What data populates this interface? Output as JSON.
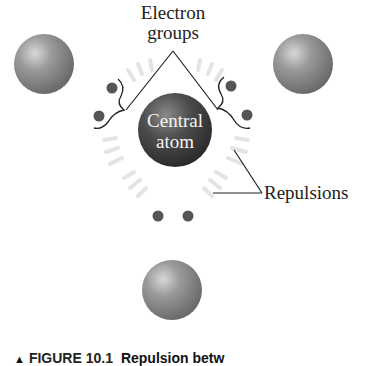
{
  "figure": {
    "labels": {
      "electron_groups_line1": "Electron",
      "electron_groups_line2": "groups",
      "central_atom_line1": "Central",
      "central_atom_line2": "atom",
      "repulsions": "Repulsions"
    },
    "caption": {
      "marker": "▲",
      "figure_number": "FIGURE 10.1",
      "title_visible": "Repulsion betw"
    },
    "colors": {
      "outer_atom": "#8a8a8a",
      "central_atom": "#4a4a4a",
      "electron_dot": "#555555",
      "repulsion_marks": "#e2e2e2",
      "line": "#222222"
    },
    "elements": {
      "outer_atoms": 3,
      "lone_pair_groups": 3,
      "central_atoms": 1
    }
  }
}
